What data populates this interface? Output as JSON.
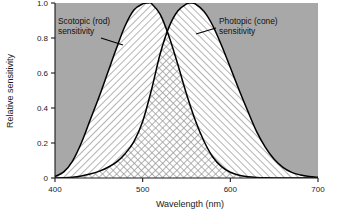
{
  "chart_data": {
    "type": "area",
    "title": "",
    "subtitle": "",
    "xlabel": "Wavelength (nm)",
    "ylabel": "Relative sensitivity",
    "xlim": [
      400,
      700
    ],
    "ylim": [
      0,
      1.0
    ],
    "xticks": [
      400,
      500,
      600,
      700
    ],
    "xtick_labels": [
      "400",
      "500",
      "600",
      "700"
    ],
    "yticks": [
      0,
      0.2,
      0.4,
      0.6,
      0.8,
      1.0
    ],
    "ytick_labels": [
      "0",
      "0.2",
      "0.4",
      "0.6",
      "0.8",
      "1.0"
    ],
    "grid": false,
    "legend_position": "inline-annotations",
    "plot_background": "#a8a8a8",
    "figure_background": "#ffffff",
    "curve_color": "#000000",
    "series": [
      {
        "name": "Scotopic (rod) sensitivity",
        "peak_x": 507,
        "peak_y": 1.0,
        "fill_pattern": "diagonal-hatch-forward",
        "x": [
          400,
          410,
          420,
          430,
          440,
          450,
          460,
          470,
          480,
          490,
          500,
          507,
          510,
          520,
          530,
          540,
          550,
          560,
          570,
          580,
          590,
          600,
          610,
          620,
          630,
          640,
          650,
          660,
          670,
          680,
          690,
          700
        ],
        "values": [
          0.009,
          0.035,
          0.097,
          0.2,
          0.33,
          0.46,
          0.6,
          0.74,
          0.87,
          0.96,
          0.995,
          1.0,
          0.997,
          0.935,
          0.81,
          0.65,
          0.48,
          0.33,
          0.21,
          0.12,
          0.065,
          0.033,
          0.016,
          0.0075,
          0.0035,
          0.0016,
          0.0007,
          0.0003,
          0.0002,
          0.0001,
          5e-05,
          0.0
        ]
      },
      {
        "name": "Photopic (cone) sensitivity",
        "peak_x": 555,
        "peak_y": 1.0,
        "fill_pattern": "diagonal-hatch-backward",
        "x": [
          400,
          410,
          420,
          430,
          440,
          450,
          460,
          470,
          480,
          490,
          500,
          510,
          520,
          530,
          540,
          550,
          555,
          560,
          570,
          580,
          590,
          600,
          610,
          620,
          630,
          640,
          650,
          660,
          670,
          680,
          690,
          700
        ],
        "values": [
          0.0004,
          0.0012,
          0.004,
          0.0116,
          0.023,
          0.038,
          0.06,
          0.091,
          0.139,
          0.208,
          0.323,
          0.503,
          0.71,
          0.862,
          0.954,
          0.995,
          1.0,
          0.995,
          0.952,
          0.87,
          0.757,
          0.631,
          0.503,
          0.381,
          0.265,
          0.175,
          0.107,
          0.061,
          0.032,
          0.017,
          0.0082,
          0.0041
        ]
      }
    ],
    "overlap_pattern": "cross-hatch",
    "annotations": [
      {
        "id": "scotopic-label",
        "lines": [
          "Scotopic (rod)",
          "sensitivity"
        ],
        "text": "Scotopic (rod) sensitivity",
        "target_series": "Scotopic (rod) sensitivity"
      },
      {
        "id": "photopic-label",
        "lines": [
          "Photopic (cone)",
          "sensitivity"
        ],
        "text": "Photopic (cone) sensitivity",
        "target_series": "Photopic (cone) sensitivity"
      }
    ]
  }
}
